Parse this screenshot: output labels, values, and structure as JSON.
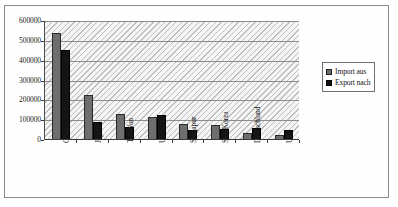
{
  "chart_data": {
    "type": "bar",
    "title": "",
    "subtitle": "",
    "xlabel": "",
    "ylabel": "",
    "ylim": [
      0,
      600000
    ],
    "ytick_labels": [
      "600000",
      "500000",
      "400000",
      "300000",
      "200000",
      "100000",
      "0"
    ],
    "ytick_values": [
      600000,
      500000,
      400000,
      300000,
      200000,
      100000,
      0
    ],
    "grid": true,
    "legend_position": "right",
    "categories": [
      "China",
      "Japan",
      "Tai-Wan",
      "USA",
      "Singapur",
      "Süd-Korea",
      "Deutschland",
      "UK"
    ],
    "series": [
      {
        "name": "Import aus",
        "color": "#6e6e6e",
        "values": [
          535000,
          222000,
          128000,
          112000,
          78000,
          72000,
          30000,
          18000
        ]
      },
      {
        "name": "Export nach",
        "color": "#141414",
        "values": [
          450000,
          85000,
          60000,
          122000,
          45000,
          48000,
          58000,
          45000
        ]
      }
    ]
  },
  "legend": {
    "items": [
      {
        "label": "Import aus",
        "swatch": "import"
      },
      {
        "label": "Export nach",
        "swatch": "export"
      }
    ]
  }
}
